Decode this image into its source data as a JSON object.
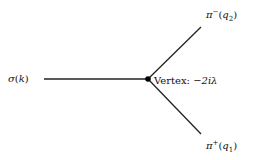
{
  "diagram": {
    "type": "feynman-vertex",
    "incoming": {
      "symbol": "σ",
      "arg": "k"
    },
    "outgoing_top": {
      "symbol": "π",
      "charge": "−",
      "arg": "q",
      "sub": "2"
    },
    "outgoing_bottom": {
      "symbol": "π",
      "charge": "+",
      "arg": "q",
      "sub": "1"
    },
    "vertex_label": "Vertex:",
    "vertex_factor": "−2iλ",
    "colors": {
      "line": "#222222",
      "vertex": "#000000",
      "background": "#ffffff"
    }
  }
}
